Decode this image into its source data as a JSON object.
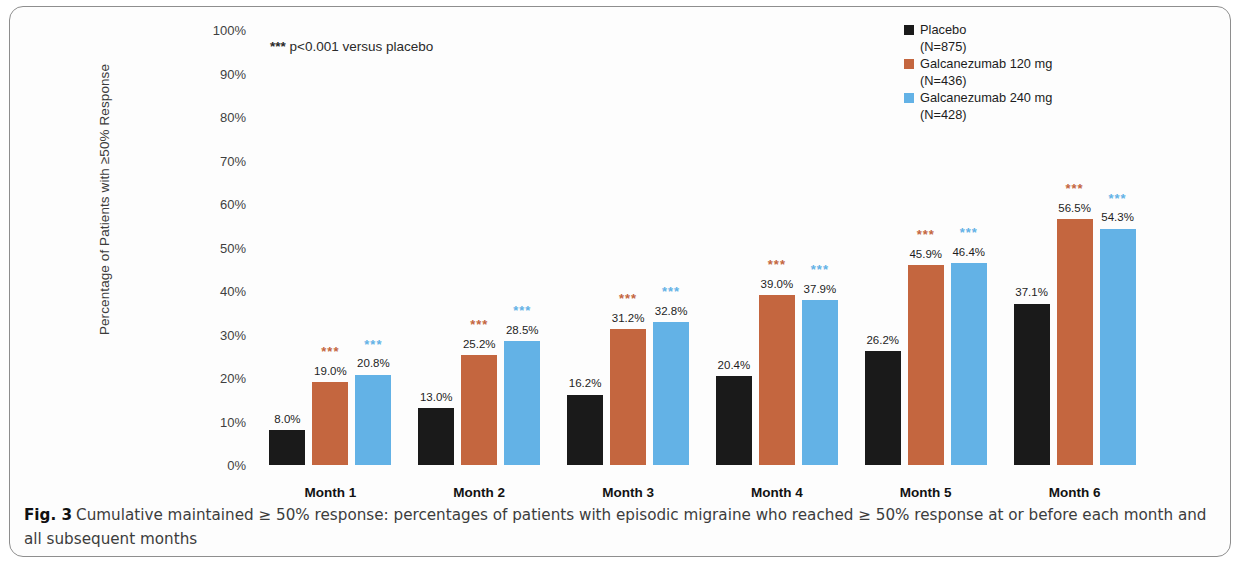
{
  "figure": {
    "caption_label": "Fig. 3",
    "caption_text": "Cumulative maintained ≥ 50% response: percentages of patients with episodic migraine who reached ≥ 50% response at or before each month and all subsequent months"
  },
  "annotations": {
    "significance_marker": "***",
    "pvalue_marker": "***",
    "pvalue_note": "p<0.001 versus placebo"
  },
  "legend": {
    "position": "top-right",
    "entries": [
      {
        "label": "Placebo",
        "n": "(N=875)",
        "color": "#1a1a1a"
      },
      {
        "label": "Galcanezumab 120 mg",
        "n": "(N=436)",
        "color": "#c4663f"
      },
      {
        "label": "Galcanezumab 240 mg",
        "n": "(N=428)",
        "color": "#63b2e6"
      }
    ]
  },
  "chart_data": {
    "type": "bar",
    "title": "",
    "subtitle": "",
    "xlabel": "",
    "ylabel": "Percentage of Patients with ≥50% Response",
    "categories": [
      "Month 1",
      "Month 2",
      "Month 3",
      "Month 4",
      "Month 5",
      "Month 6"
    ],
    "ylim": [
      0,
      100
    ],
    "yticks": [
      "0%",
      "10%",
      "20%",
      "30%",
      "40%",
      "50%",
      "60%",
      "70%",
      "80%",
      "90%",
      "100%"
    ],
    "ytick_values": [
      0,
      10,
      20,
      30,
      40,
      50,
      60,
      70,
      80,
      90,
      100
    ],
    "grid": false,
    "legend_position": "top-right",
    "series": [
      {
        "name": "Placebo",
        "n": 875,
        "color": "#1a1a1a",
        "values": [
          8.0,
          13.0,
          16.2,
          20.4,
          26.2,
          37.1
        ],
        "labels": [
          "8.0%",
          "13.0%",
          "16.2%",
          "20.4%",
          "26.2%",
          "37.1%"
        ],
        "significance": [
          "",
          "",
          "",
          "",
          "",
          ""
        ]
      },
      {
        "name": "Galcanezumab 120 mg",
        "n": 436,
        "color": "#c4663f",
        "values": [
          19.0,
          25.2,
          31.2,
          39.0,
          45.9,
          56.5
        ],
        "labels": [
          "19.0%",
          "25.2%",
          "31.2%",
          "39.0%",
          "45.9%",
          "56.5%"
        ],
        "significance": [
          "***",
          "***",
          "***",
          "***",
          "***",
          "***"
        ]
      },
      {
        "name": "Galcanezumab 240 mg",
        "n": 428,
        "color": "#63b2e6",
        "values": [
          20.8,
          28.5,
          32.8,
          37.9,
          46.4,
          54.3
        ],
        "labels": [
          "20.8%",
          "28.5%",
          "32.8%",
          "37.9%",
          "46.4%",
          "54.3%"
        ],
        "significance": [
          "***",
          "***",
          "***",
          "***",
          "***",
          "***"
        ]
      }
    ]
  }
}
